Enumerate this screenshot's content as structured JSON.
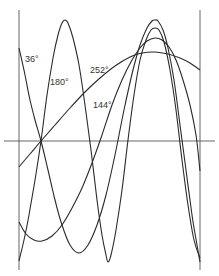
{
  "diagram": {
    "type": "phase-waveforms",
    "axes": {
      "horizontal": {
        "x1": 4,
        "x2": 215,
        "y": 141
      },
      "left_vertical": {
        "x": 19,
        "y1": 10,
        "y2": 270
      },
      "right_vertical": {
        "x": 200,
        "y1": 10,
        "y2": 270
      }
    },
    "curves": [
      {
        "label": "36°",
        "label_pos": [
          25,
          62
        ],
        "points": [
          [
            19,
            48
          ],
          [
            25,
            75
          ],
          [
            30,
            100
          ],
          [
            35,
            120
          ],
          [
            41,
            141
          ],
          [
            48,
            170
          ],
          [
            55,
            200
          ],
          [
            62,
            225
          ],
          [
            70,
            245
          ],
          [
            79,
            253
          ],
          [
            88,
            245
          ],
          [
            97,
            225
          ],
          [
            106,
            195
          ],
          [
            115,
            155
          ],
          [
            124,
            110
          ],
          [
            133,
            70
          ],
          [
            140,
            45
          ],
          [
            147,
            28
          ],
          [
            152,
            21
          ],
          [
            155,
            20
          ],
          [
            158,
            21
          ],
          [
            163,
            30
          ],
          [
            168,
            48
          ],
          [
            174,
            80
          ],
          [
            180,
            125
          ],
          [
            186,
            170
          ],
          [
            192,
            215
          ],
          [
            197,
            245
          ],
          [
            200,
            262
          ]
        ]
      },
      {
        "label": "180°",
        "label_pos": [
          50,
          85
        ],
        "points": [
          [
            19,
            261
          ],
          [
            24,
            240
          ],
          [
            29,
            215
          ],
          [
            35,
            180
          ],
          [
            41,
            141
          ],
          [
            47,
            95
          ],
          [
            53,
            58
          ],
          [
            58,
            35
          ],
          [
            62,
            23
          ],
          [
            65,
            20
          ],
          [
            68,
            23
          ],
          [
            73,
            38
          ],
          [
            79,
            65
          ],
          [
            85,
            105
          ],
          [
            91,
            150
          ],
          [
            97,
            200
          ],
          [
            102,
            235
          ],
          [
            106,
            255
          ],
          [
            108,
            262
          ],
          [
            111,
            255
          ],
          [
            116,
            230
          ],
          [
            122,
            190
          ],
          [
            128,
            140
          ],
          [
            134,
            95
          ],
          [
            140,
            60
          ],
          [
            146,
            40
          ],
          [
            151,
            30
          ],
          [
            155,
            28
          ],
          [
            159,
            30
          ],
          [
            164,
            42
          ],
          [
            170,
            70
          ],
          [
            176,
            110
          ],
          [
            182,
            160
          ],
          [
            188,
            205
          ],
          [
            194,
            240
          ],
          [
            200,
            258
          ]
        ]
      },
      {
        "label": "144°",
        "label_pos": [
          93,
          108
        ],
        "points": [
          [
            19,
            222
          ],
          [
            26,
            234
          ],
          [
            34,
            240
          ],
          [
            42,
            241
          ],
          [
            52,
            236
          ],
          [
            62,
            225
          ],
          [
            72,
            208
          ],
          [
            82,
            188
          ],
          [
            92,
            163
          ],
          [
            102,
            135
          ],
          [
            112,
            105
          ],
          [
            122,
            80
          ],
          [
            132,
            60
          ],
          [
            140,
            48
          ],
          [
            147,
            41
          ],
          [
            155,
            38
          ],
          [
            162,
            40
          ],
          [
            169,
            47
          ],
          [
            176,
            60
          ],
          [
            183,
            80
          ],
          [
            190,
            105
          ],
          [
            196,
            135
          ],
          [
            200,
            171
          ]
        ]
      },
      {
        "label": "252°",
        "label_pos": [
          90,
          73
        ],
        "points": [
          [
            19,
            167
          ],
          [
            30,
            154
          ],
          [
            41,
            141
          ],
          [
            55,
            125
          ],
          [
            70,
            108
          ],
          [
            85,
            92
          ],
          [
            100,
            78
          ],
          [
            115,
            66
          ],
          [
            130,
            57
          ],
          [
            142,
            53
          ],
          [
            155,
            52
          ],
          [
            168,
            54
          ],
          [
            180,
            58
          ],
          [
            190,
            63
          ],
          [
            200,
            70
          ]
        ]
      }
    ]
  },
  "labels": {
    "c36": "36°",
    "c180": "180°",
    "c144": "144°",
    "c252": "252°"
  }
}
